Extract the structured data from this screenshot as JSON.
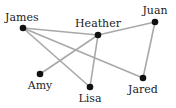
{
  "diagram": {
    "type": "graph",
    "edge_color": "#a8a8a8",
    "node_color": "#111111",
    "nodes": [
      {
        "id": "James",
        "label": "James",
        "x": 23,
        "y": 28,
        "lx": 5,
        "ly": 21,
        "anchor": "start"
      },
      {
        "id": "Heather",
        "label": "Heather",
        "x": 98,
        "y": 35,
        "lx": 98,
        "ly": 27,
        "anchor": "middle"
      },
      {
        "id": "Juan",
        "label": "Juan",
        "x": 155,
        "y": 22,
        "lx": 155,
        "ly": 14,
        "anchor": "middle"
      },
      {
        "id": "Amy",
        "label": "Amy",
        "x": 40,
        "y": 74,
        "lx": 40,
        "ly": 89,
        "anchor": "middle"
      },
      {
        "id": "Lisa",
        "label": "Lisa",
        "x": 90,
        "y": 87,
        "lx": 90,
        "ly": 102,
        "anchor": "middle"
      },
      {
        "id": "Jared",
        "label": "Jared",
        "x": 143,
        "y": 78,
        "lx": 143,
        "ly": 93,
        "anchor": "middle"
      }
    ],
    "edges": [
      [
        "James",
        "Heather"
      ],
      [
        "James",
        "Lisa"
      ],
      [
        "James",
        "Jared"
      ],
      [
        "Heather",
        "Juan"
      ],
      [
        "Heather",
        "Amy"
      ],
      [
        "Heather",
        "Lisa"
      ],
      [
        "Juan",
        "Jared"
      ]
    ]
  }
}
